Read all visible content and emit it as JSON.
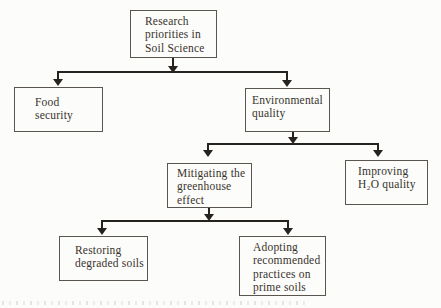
{
  "diagram": {
    "type": "flowchart",
    "nodes": {
      "research": {
        "label": "Research\npriorities in\nSoil Science"
      },
      "food": {
        "label": "Food\nsecurity"
      },
      "environmental": {
        "label": "Environmental\nquality"
      },
      "mitigating": {
        "label": "Mitigating the\ngreenhouse\neffect"
      },
      "improving": {
        "label": "Improving\nH₂O quality"
      },
      "restoring": {
        "label": "Restoring\ndegraded soils"
      },
      "adopting": {
        "label": "Adopting\nrecommended\npractices on\nprime soils"
      }
    },
    "edges": [
      {
        "from": "research",
        "to": [
          "food",
          "environmental"
        ]
      },
      {
        "from": "environmental",
        "to": [
          "mitigating",
          "improving"
        ]
      },
      {
        "from": "mitigating",
        "to": [
          "restoring",
          "adopting"
        ]
      }
    ],
    "colors": {
      "line": "#26231f",
      "box_border": "#5a554e",
      "text": "#38332c",
      "background": "#fcfcfa"
    }
  }
}
